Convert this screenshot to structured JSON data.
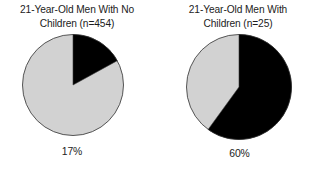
{
  "figure": {
    "background_color": "#ffffff",
    "slice_colors": {
      "highlight": "#000000",
      "remainder": "#d2d2d2",
      "outline": "#555555"
    },
    "panels": [
      {
        "id": "men-no-children",
        "title": "21-Year-Old Men With No\nChildren (n=454)",
        "percent_label": "17%",
        "pie": {
          "diameter_px": 101,
          "highlight_percent": 17,
          "remainder_percent": 83,
          "start_angle_deg": 0,
          "direction": "clockwise"
        }
      },
      {
        "id": "men-with-children",
        "title": "21-Year-Old Men With\nChildren (n=25)",
        "percent_label": "60%",
        "pie": {
          "diameter_px": 105,
          "highlight_percent": 60,
          "remainder_percent": 40,
          "start_angle_deg": 0,
          "direction": "clockwise"
        }
      }
    ]
  },
  "chart_data": {
    "type": "pie",
    "title": "",
    "charts": [
      {
        "title": "21-Year-Old Men With No Children (n=454)",
        "group": "21-Year-Old Men With No Children",
        "sample_size": 454,
        "labels": [
          "Highlighted",
          "Remainder"
        ],
        "values": [
          17,
          83
        ],
        "data_label": "17%",
        "colors": [
          "#000000",
          "#d2d2d2"
        ],
        "start_angle_deg": 90,
        "counterclock": false
      },
      {
        "title": "21-Year-Old Men With Children (n=25)",
        "group": "21-Year-Old Men With Children",
        "sample_size": 25,
        "labels": [
          "Highlighted",
          "Remainder"
        ],
        "values": [
          60,
          40
        ],
        "data_label": "60%",
        "colors": [
          "#000000",
          "#d2d2d2"
        ],
        "start_angle_deg": 90,
        "counterclock": false
      }
    ],
    "legend": null,
    "grid": false
  }
}
